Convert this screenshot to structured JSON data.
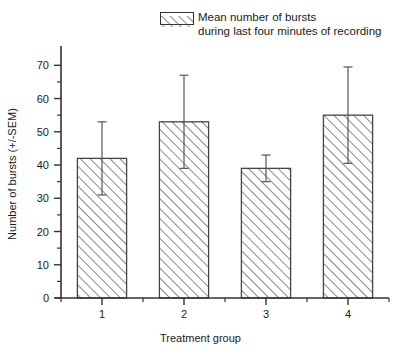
{
  "chart_data": {
    "type": "bar",
    "title": "",
    "xlabel": "Treatment group",
    "ylabel": "Number of bursts (+/-SEM)",
    "categories": [
      "1",
      "2",
      "3",
      "4"
    ],
    "values": [
      42,
      53,
      39,
      55
    ],
    "errors": [
      11,
      14,
      4,
      14.5
    ],
    "ylim": [
      0,
      74
    ],
    "ytick_labels": [
      "0",
      "10",
      "20",
      "30",
      "40",
      "50",
      "60",
      "70"
    ],
    "ytick_values": [
      0,
      10,
      20,
      30,
      40,
      50,
      60,
      70
    ],
    "yminor_values": [
      5,
      15,
      25,
      35,
      45,
      55,
      65
    ],
    "grid": false,
    "legend_position": "top-right",
    "series_name": "Mean number of bursts during last four minutes of recording",
    "fill": "diagonal-hatch",
    "colors": {
      "axis": "#333333",
      "bar_edge": "#444444",
      "bar_fill": "#ffffff",
      "hatch": "#555555",
      "error_bar": "#555555",
      "text": "#1a1a1a"
    }
  },
  "legend": {
    "swatch_icon": "hatched-rectangle-icon",
    "line1": "Mean number of bursts",
    "line2": "during last four minutes of recording"
  },
  "axes": {
    "y_title": "Number of bursts (+/-SEM)",
    "x_title": "Treatment group"
  }
}
